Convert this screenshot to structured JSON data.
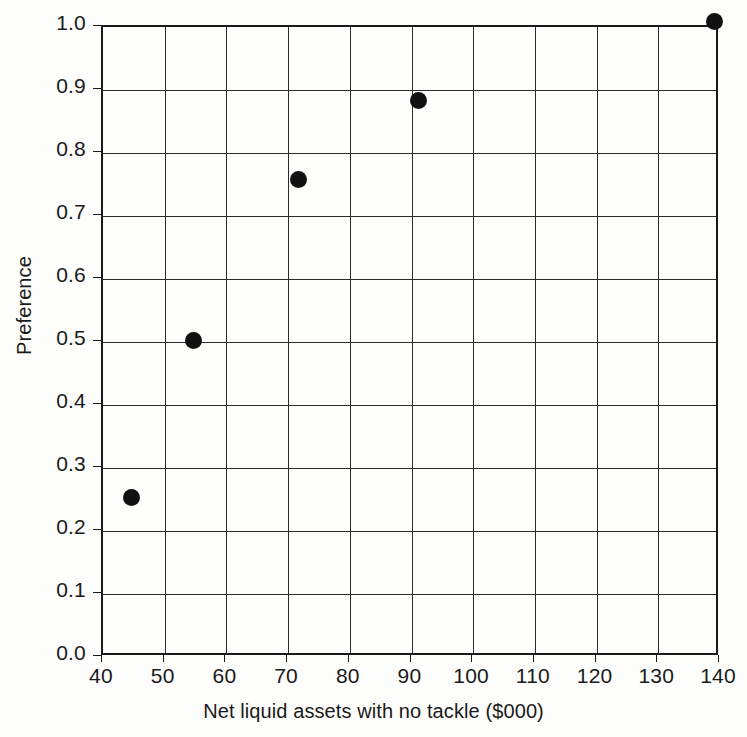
{
  "chart_data": {
    "type": "scatter",
    "title": "",
    "xlabel": "Net liquid assets with no tackle ($000)",
    "ylabel": "Preference",
    "xlim": [
      40,
      140
    ],
    "ylim": [
      0.0,
      1.0
    ],
    "grid": true,
    "legend": null,
    "x_ticks": [
      40,
      50,
      60,
      70,
      80,
      90,
      100,
      110,
      120,
      130,
      140
    ],
    "x_tick_labels": [
      "40",
      "50",
      "60",
      "70",
      "80",
      "90",
      "100",
      "110",
      "120",
      "130",
      "140"
    ],
    "y_ticks": [
      0.0,
      0.1,
      0.2,
      0.3,
      0.4,
      0.5,
      0.6,
      0.7,
      0.8,
      0.9,
      1.0
    ],
    "y_tick_labels": [
      "0.0",
      "0.1",
      "0.2",
      "0.3",
      "0.4",
      "0.5",
      "0.6",
      "0.7",
      "0.8",
      "0.9",
      "1.0"
    ],
    "points": [
      {
        "x": 45.0,
        "y": 0.25
      },
      {
        "x": 55.0,
        "y": 0.5
      },
      {
        "x": 72.0,
        "y": 0.755
      },
      {
        "x": 91.5,
        "y": 0.88
      },
      {
        "x": 139.5,
        "y": 1.005
      }
    ],
    "marker": "filled-circle",
    "marker_color": "#111111"
  }
}
